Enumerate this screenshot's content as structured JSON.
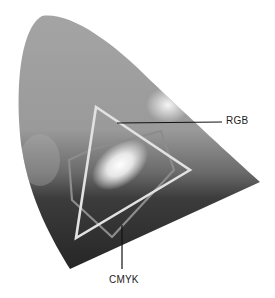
{
  "diagram": {
    "labels": {
      "rgb": "RGB",
      "cmyk": "CMYK"
    },
    "colors": {
      "background": "#ffffff",
      "gamut_light": "#a8a8a8",
      "gamut_dark": "#2a2a2a",
      "rgb_outline": "#e2e2e2",
      "cmyk_outline": "#8c8c8c",
      "leader_line": "#111111",
      "label_text": "#222222"
    },
    "shapes": {
      "gamut": "horseshoe (chromaticity diagram)",
      "rgb": "triangle",
      "cmyk": "irregular hexagon"
    }
  }
}
